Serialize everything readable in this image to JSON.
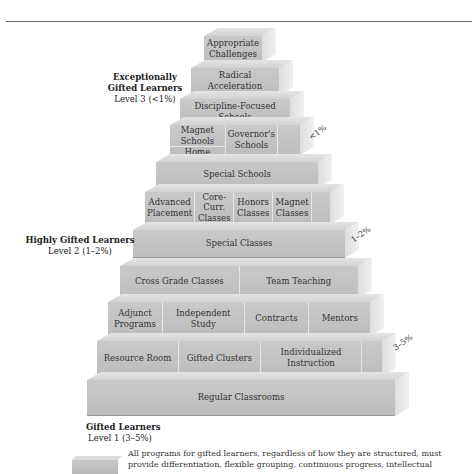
{
  "header": {
    "rule": true
  },
  "levels": [
    {
      "title": "Exceptionally Gifted Learners",
      "title_line1": "Exceptionally",
      "title_line2": "Gifted Learners",
      "subtitle": "Level 3 (<1%)"
    },
    {
      "title": "Highly Gifted Learners",
      "subtitle": "Level 2 (1–2%)"
    },
    {
      "title": "Gifted Learners",
      "subtitle": "Level 1 (3–5%)"
    }
  ],
  "percent_tags": [
    "<1%",
    "1–2%",
    "3–5%"
  ],
  "tiers": [
    {
      "cells": [
        "Appropriate Challenges"
      ]
    },
    {
      "cells": [
        "Radical Acceleration"
      ]
    },
    {
      "cells": [
        "Discipline-Focused Schools"
      ]
    },
    {
      "stack": [
        "Magnet Schools",
        "Home Schooling"
      ],
      "cells": [
        "Governor's Schools"
      ]
    },
    {
      "cells": [
        "Special Schools"
      ]
    },
    {
      "cells": [
        "Advanced Placement",
        "Core-Curr. Classes",
        "Honors Classes",
        "Magnet Classes"
      ]
    },
    {
      "cells": [
        "Special Classes"
      ]
    },
    {
      "cells": [
        "Cross Grade Classes",
        "Team Teaching"
      ]
    },
    {
      "cells": [
        "Adjunct Programs",
        "Independent Study",
        "Contracts",
        "Mentors"
      ]
    },
    {
      "cells": [
        "Resource Room",
        "Gifted Clusters",
        "Individualized Instruction"
      ]
    },
    {
      "cells": [
        "Regular Classrooms"
      ]
    }
  ],
  "note": "All programs for gifted learners, regardless of how they are structured, must provide differentiation, flexible grouping, continuous progress, intellectual"
}
